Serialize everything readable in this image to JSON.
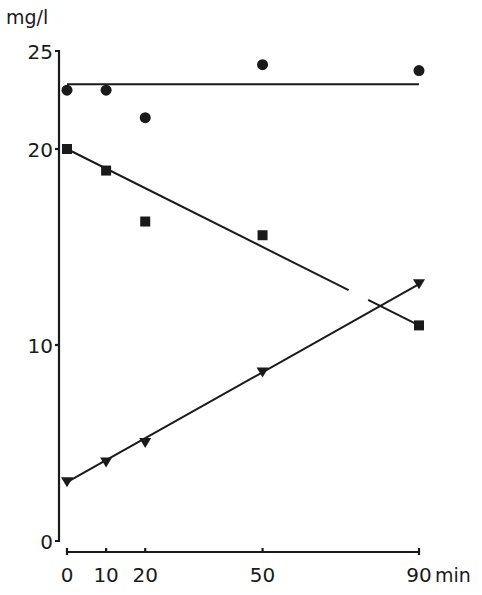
{
  "chart_data": {
    "type": "scatter",
    "title": "",
    "xlabel": "min",
    "ylabel": "mg/l",
    "xlim": [
      0,
      90
    ],
    "ylim": [
      0,
      25
    ],
    "x_ticks": [
      0,
      10,
      20,
      50,
      90
    ],
    "x_tick_labels": [
      "0",
      "10",
      "20",
      "50",
      "90"
    ],
    "y_ticks": [
      0,
      10,
      20,
      25
    ],
    "y_tick_labels": [
      "0",
      "10",
      "20",
      "25"
    ],
    "grid": false,
    "legend": null,
    "series": [
      {
        "name": "circles",
        "marker": "circle",
        "x": [
          0,
          10,
          20,
          50,
          90
        ],
        "y": [
          23.0,
          23.0,
          21.6,
          24.3,
          24.0
        ],
        "fit_line": {
          "x": [
            0,
            90
          ],
          "y": [
            23.3,
            23.3
          ]
        }
      },
      {
        "name": "squares",
        "marker": "square",
        "x": [
          0,
          10,
          20,
          50,
          90
        ],
        "y": [
          20.0,
          18.9,
          16.3,
          15.6,
          11.0
        ],
        "fit_line": {
          "x": [
            0,
            90
          ],
          "y": [
            20.0,
            11.0
          ],
          "gap_x": [
            72,
            77
          ]
        }
      },
      {
        "name": "triangles",
        "marker": "triangle-down",
        "x": [
          0,
          10,
          20,
          50,
          90
        ],
        "y": [
          3.0,
          4.0,
          5.0,
          8.6,
          13.1
        ],
        "fit_line": {
          "x": [
            0,
            90
          ],
          "y": [
            3.0,
            13.1
          ]
        }
      }
    ]
  },
  "axes": {
    "y_unit_label": "mg/l",
    "x_unit_label": "min"
  }
}
